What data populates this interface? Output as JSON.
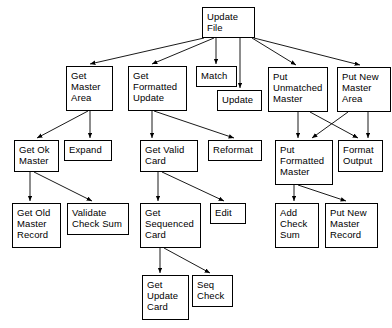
{
  "diagram": {
    "type": "structure-chart",
    "background_color": "#ffffff",
    "line_color": "#000000",
    "box_border_color": "#000000",
    "box_fill_color": "#ffffff",
    "text_color": "#000000",
    "nodes": [
      {
        "id": "update-file",
        "label": "Update\nFile",
        "x": 202,
        "y": 7,
        "w": 53,
        "h": 31
      },
      {
        "id": "get-master-area",
        "label": "Get\nMaster\nArea",
        "x": 66,
        "y": 66,
        "w": 47,
        "h": 45
      },
      {
        "id": "get-formatted-update",
        "label": "Get\nFormatted\nUpdate",
        "x": 128,
        "y": 66,
        "w": 59,
        "h": 45
      },
      {
        "id": "match",
        "label": "Match",
        "x": 196,
        "y": 66,
        "w": 41,
        "h": 21
      },
      {
        "id": "update",
        "label": "Update",
        "x": 217,
        "y": 90,
        "w": 45,
        "h": 21
      },
      {
        "id": "put-unmatched-master",
        "label": "Put\nUnmatched\nMaster",
        "x": 268,
        "y": 67,
        "w": 60,
        "h": 45
      },
      {
        "id": "put-new-master-area",
        "label": "Put New\nMaster\nArea",
        "x": 337,
        "y": 67,
        "w": 54,
        "h": 45
      },
      {
        "id": "get-ok-master",
        "label": "Get Ok\nMaster",
        "x": 14,
        "y": 140,
        "w": 45,
        "h": 32
      },
      {
        "id": "expand",
        "label": "Expand",
        "x": 64,
        "y": 140,
        "w": 48,
        "h": 21
      },
      {
        "id": "get-valid-card",
        "label": "Get Valid\nCard",
        "x": 140,
        "y": 140,
        "w": 58,
        "h": 32
      },
      {
        "id": "reformat",
        "label": "Reformat",
        "x": 208,
        "y": 140,
        "w": 54,
        "h": 21
      },
      {
        "id": "put-formatted-master",
        "label": "Put\nFormatted\nMaster",
        "x": 275,
        "y": 140,
        "w": 58,
        "h": 45
      },
      {
        "id": "format-output",
        "label": "Format\nOutput",
        "x": 338,
        "y": 140,
        "w": 45,
        "h": 32
      },
      {
        "id": "get-old-master-record",
        "label": "Get Old\nMaster\nRecord",
        "x": 12,
        "y": 203,
        "w": 49,
        "h": 45
      },
      {
        "id": "validate-check-sum",
        "label": "Validate\nCheck Sum",
        "x": 67,
        "y": 203,
        "w": 62,
        "h": 32
      },
      {
        "id": "get-sequenced-card",
        "label": "Get\nSequenced\nCard",
        "x": 140,
        "y": 203,
        "w": 61,
        "h": 45
      },
      {
        "id": "edit",
        "label": "Edit",
        "x": 210,
        "y": 203,
        "w": 36,
        "h": 21
      },
      {
        "id": "add-check-sum",
        "label": "Add\nCheck\nSum",
        "x": 275,
        "y": 203,
        "w": 44,
        "h": 45
      },
      {
        "id": "put-new-master-record",
        "label": "Put New\nMaster\nRecord",
        "x": 325,
        "y": 203,
        "w": 53,
        "h": 45
      },
      {
        "id": "get-update-card",
        "label": "Get\nUpdate\nCard",
        "x": 142,
        "y": 275,
        "w": 47,
        "h": 45
      },
      {
        "id": "seq-check",
        "label": "Seq\nCheck",
        "x": 192,
        "y": 275,
        "w": 41,
        "h": 32
      }
    ],
    "edges": [
      {
        "from": "update-file",
        "to": "get-master-area",
        "x1": 204,
        "y1": 38,
        "x2": 90,
        "y2": 64
      },
      {
        "from": "update-file",
        "to": "get-formatted-update",
        "x1": 214,
        "y1": 38,
        "x2": 152,
        "y2": 64
      },
      {
        "from": "update-file",
        "to": "match",
        "x1": 216,
        "y1": 38,
        "x2": 216,
        "y2": 64
      },
      {
        "from": "update-file",
        "to": "update",
        "x1": 240,
        "y1": 38,
        "x2": 240,
        "y2": 88
      },
      {
        "from": "update-file",
        "to": "put-unmatched-master",
        "x1": 252,
        "y1": 38,
        "x2": 296,
        "y2": 65
      },
      {
        "from": "update-file",
        "to": "put-new-master-area",
        "x1": 254,
        "y1": 38,
        "x2": 360,
        "y2": 65
      },
      {
        "from": "get-master-area",
        "to": "get-ok-master",
        "x1": 88,
        "y1": 111,
        "x2": 37,
        "y2": 138
      },
      {
        "from": "get-master-area",
        "to": "expand",
        "x1": 90,
        "y1": 111,
        "x2": 90,
        "y2": 138
      },
      {
        "from": "get-formatted-update",
        "to": "get-valid-card",
        "x1": 152,
        "y1": 111,
        "x2": 152,
        "y2": 138
      },
      {
        "from": "get-formatted-update",
        "to": "reformat",
        "x1": 154,
        "y1": 111,
        "x2": 234,
        "y2": 138
      },
      {
        "from": "put-unmatched-master",
        "to": "put-formatted-master",
        "x1": 298,
        "y1": 112,
        "x2": 298,
        "y2": 138
      },
      {
        "from": "put-unmatched-master",
        "to": "format-output",
        "x1": 310,
        "y1": 112,
        "x2": 358,
        "y2": 138
      },
      {
        "from": "put-new-master-area",
        "to": "put-formatted-master",
        "x1": 348,
        "y1": 112,
        "x2": 312,
        "y2": 138
      },
      {
        "from": "put-new-master-area",
        "to": "format-output",
        "x1": 368,
        "y1": 112,
        "x2": 368,
        "y2": 138
      },
      {
        "from": "get-ok-master",
        "to": "get-old-master-record",
        "x1": 30,
        "y1": 172,
        "x2": 30,
        "y2": 201
      },
      {
        "from": "get-ok-master",
        "to": "validate-check-sum",
        "x1": 34,
        "y1": 172,
        "x2": 92,
        "y2": 201
      },
      {
        "from": "get-valid-card",
        "to": "get-sequenced-card",
        "x1": 158,
        "y1": 172,
        "x2": 158,
        "y2": 201
      },
      {
        "from": "get-valid-card",
        "to": "edit",
        "x1": 162,
        "y1": 172,
        "x2": 224,
        "y2": 201
      },
      {
        "from": "put-formatted-master",
        "to": "add-check-sum",
        "x1": 294,
        "y1": 185,
        "x2": 294,
        "y2": 201
      },
      {
        "from": "put-formatted-master",
        "to": "put-new-master-record",
        "x1": 298,
        "y1": 185,
        "x2": 346,
        "y2": 201
      },
      {
        "from": "get-sequenced-card",
        "to": "get-update-card",
        "x1": 160,
        "y1": 248,
        "x2": 160,
        "y2": 273
      },
      {
        "from": "get-sequenced-card",
        "to": "seq-check",
        "x1": 164,
        "y1": 248,
        "x2": 210,
        "y2": 273
      }
    ]
  }
}
